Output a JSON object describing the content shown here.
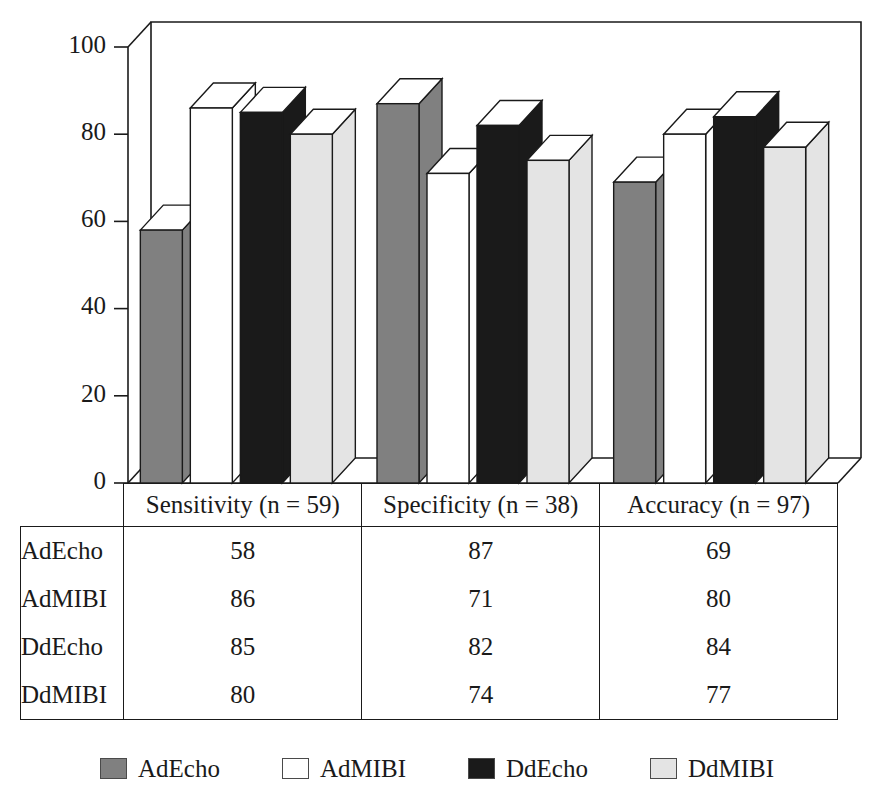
{
  "chart_data": {
    "type": "bar",
    "title": "",
    "subtitle": "",
    "xlabel": "",
    "ylabel": "",
    "ylim": [
      0,
      100
    ],
    "yticks": [
      0,
      20,
      40,
      60,
      80,
      100
    ],
    "grid": false,
    "legend_position": "bottom",
    "three_d": true,
    "categories": [
      "Sensitivity (n = 59)",
      "Specificity (n = 38)",
      "Accuracy (n = 97)"
    ],
    "series": [
      {
        "name": "AdEcho",
        "values": [
          58,
          87,
          69
        ],
        "color": "#808080"
      },
      {
        "name": "AdMIBI",
        "values": [
          86,
          71,
          80
        ],
        "color": "#ffffff"
      },
      {
        "name": "DdEcho",
        "values": [
          85,
          82,
          84
        ],
        "color": "#1a1a1a"
      },
      {
        "name": "DdMIBI",
        "values": [
          80,
          74,
          77
        ],
        "color": "#e4e4e4"
      }
    ]
  },
  "axis": {
    "tick_labels": [
      "100",
      "80",
      "60",
      "40",
      "20",
      "0"
    ]
  },
  "table": {
    "corner_label": "",
    "column_headers": [
      "Sensitivity (n = 59)",
      "Specificity (n = 38)",
      "Accuracy (n = 97)"
    ],
    "rows": [
      {
        "label": "AdEcho",
        "values": [
          "58",
          "87",
          "69"
        ]
      },
      {
        "label": "AdMIBI",
        "values": [
          "86",
          "71",
          "80"
        ]
      },
      {
        "label": "DdEcho",
        "values": [
          "85",
          "82",
          "84"
        ]
      },
      {
        "label": "DdMIBI",
        "values": [
          "80",
          "74",
          "77"
        ]
      }
    ]
  },
  "legend": {
    "items": [
      {
        "label": "AdEcho",
        "color": "#808080"
      },
      {
        "label": "AdMIBI",
        "color": "#ffffff"
      },
      {
        "label": "DdEcho",
        "color": "#1a1a1a"
      },
      {
        "label": "DdMIBI",
        "color": "#e4e4e4"
      }
    ]
  },
  "colors": {
    "line": "#1a1a1a",
    "background": "#ffffff",
    "series_gray": "#808080",
    "series_white": "#ffffff",
    "series_black": "#1a1a1a",
    "series_lightgray": "#e4e4e4"
  }
}
